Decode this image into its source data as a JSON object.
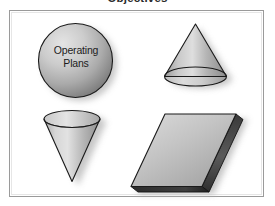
{
  "figure": {
    "title": "Objectives",
    "background_color": "#ffffff",
    "frame": {
      "border_color": "#9a9a9a",
      "inner_border_color": "#e6e6e6",
      "fill": "#ffffff"
    }
  },
  "shapes": [
    {
      "id": "sphere",
      "name": "sphere",
      "label_line1": "Operating",
      "label_line2": "Plans",
      "position": "top-left",
      "fill_light": "#d9d9d9",
      "fill_dark": "#808080",
      "outline": "#1a1a1a",
      "shadow": "#b9b9b9"
    },
    {
      "id": "cone-up",
      "name": "cone-upright",
      "label_line1": "",
      "label_line2": "",
      "position": "top-right",
      "fill_light": "#dcdcdc",
      "fill_dark": "#8a8a8a",
      "outline": "#1a1a1a",
      "shadow": "#bcbcbc"
    },
    {
      "id": "cone-down",
      "name": "cone-inverted",
      "label_line1": "",
      "label_line2": "",
      "position": "bottom-left",
      "fill_light": "#e0e0e0",
      "fill_dark": "#8e8e8e",
      "outline": "#1a1a1a",
      "shadow": "#bcbcbc"
    },
    {
      "id": "slab",
      "name": "parallelogram-slab",
      "label_line1": "",
      "label_line2": "",
      "position": "bottom-right",
      "fill_light": "#d2d2d2",
      "fill_dark": "#8c8c8c",
      "outline": "#1a1a1a",
      "shadow": "#bcbcbc"
    }
  ]
}
